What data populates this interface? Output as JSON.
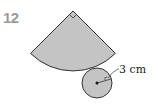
{
  "problem": {
    "number": "12"
  },
  "figure": {
    "type": "cone-net",
    "sector": {
      "angle_marker": "right-angle",
      "fill": "#c4c4c4",
      "stroke": "#333333"
    },
    "circle": {
      "radius_symbol": "r",
      "radius_label": "3 cm",
      "fill": "#c4c4c4",
      "stroke": "#333333"
    }
  }
}
